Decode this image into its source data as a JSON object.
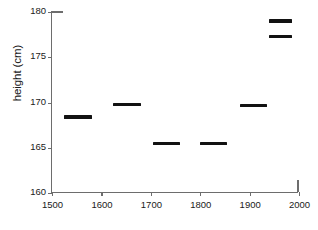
{
  "chart_data": {
    "type": "scatter",
    "title": "",
    "xlabel": "",
    "ylabel": "height (cm)",
    "xlim": [
      1500,
      2000
    ],
    "ylim": [
      160,
      180
    ],
    "xticks": [
      1500,
      1600,
      1700,
      1800,
      1900,
      2000
    ],
    "yticks": [
      160,
      165,
      170,
      175,
      180
    ],
    "grid": false,
    "legend": null,
    "marker_style": "horizontal-bar-segment",
    "series": [
      {
        "name": "mean height by period",
        "points": [
          {
            "label": "1525-1580",
            "x_start": 1525,
            "x_end": 1580,
            "x": 1552,
            "y": 168.4
          },
          {
            "label": "1623-1680",
            "x_start": 1623,
            "x_end": 1680,
            "x": 1651,
            "y": 169.8
          },
          {
            "label": "1705-1760",
            "x_start": 1705,
            "x_end": 1760,
            "x": 1732,
            "y": 165.5
          },
          {
            "label": "1800-1855",
            "x_start": 1800,
            "x_end": 1855,
            "x": 1827,
            "y": 165.5
          },
          {
            "label": "1880-1935",
            "x_start": 1880,
            "x_end": 1935,
            "x": 1907,
            "y": 169.7
          },
          {
            "label": "1940-1985 (a)",
            "x_start": 1940,
            "x_end": 1985,
            "x": 1962,
            "y": 179.0
          },
          {
            "label": "1940-1985 (b)",
            "x_start": 1940,
            "x_end": 1985,
            "x": 1962,
            "y": 177.3
          }
        ]
      }
    ]
  },
  "axis": {
    "y_label_text": "height (cm)",
    "y_tick_labels": [
      "160",
      "165",
      "170",
      "175",
      "180"
    ],
    "x_tick_labels": [
      "1500",
      "1600",
      "1700",
      "1800",
      "1900",
      "2000"
    ]
  },
  "colors": {
    "marker": "#121212",
    "axis": "#6d6d6d",
    "text": "#1a1a1a",
    "background": "#ffffff"
  }
}
